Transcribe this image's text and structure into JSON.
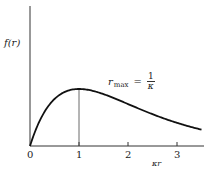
{
  "figure": {
    "y_axis_label": "f(r)",
    "x_axis_label": "κr",
    "annotation": {
      "lhs": "r",
      "subscript": "max",
      "equals": "=",
      "numerator": "1",
      "denominator": "κ"
    },
    "x_ticks": [
      "0",
      "1",
      "2",
      "3"
    ]
  },
  "chart_data": {
    "type": "line",
    "title": "",
    "xlabel": "κr",
    "ylabel": "f(r)",
    "function": "f = κr · exp(-κr)",
    "x": [
      0,
      0.25,
      0.5,
      0.75,
      1.0,
      1.25,
      1.5,
      1.75,
      2.0,
      2.25,
      2.5,
      2.75,
      3.0,
      3.25,
      3.5
    ],
    "values": [
      0,
      0.195,
      0.303,
      0.354,
      0.368,
      0.358,
      0.335,
      0.304,
      0.271,
      0.237,
      0.205,
      0.175,
      0.149,
      0.126,
      0.106
    ],
    "xlim": [
      0,
      3.5
    ],
    "x_tick_labels": [
      "0",
      "1",
      "2",
      "3"
    ],
    "annotations": [
      "r_max = 1/κ",
      "vertical line at κr = 1"
    ],
    "grid": false
  }
}
